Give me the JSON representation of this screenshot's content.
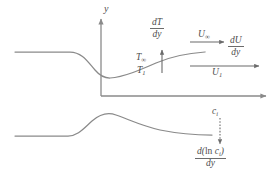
{
  "figure": {
    "type": "boundary-layer-gradient-diagram",
    "background_color": "#ffffff",
    "line_color": "#8a8a8a",
    "text_color": "#4d4d4d"
  },
  "axes": {
    "y_label": "y",
    "x_label": ""
  },
  "upper_plot": {
    "name": "temperature-profile",
    "curve_description": "flat at left, dips to minimum near axis, rises to right",
    "labels": {
      "T_infinity": "T",
      "T_infinity_sub": "∞",
      "T_one": "T",
      "T_one_sub": "1",
      "U_infinity": "U",
      "U_infinity_sub": "∞",
      "U_one": "U",
      "U_one_sub": "1"
    },
    "gradients": {
      "dT_dy_num": "dT",
      "dT_dy_den": "dy",
      "dU_dy_num": "dU",
      "dU_dy_den": "dy"
    }
  },
  "lower_plot": {
    "name": "concentration-profile",
    "curve_description": "flat at left, rises to a peak, then decays gently to right",
    "labels": {
      "c_i": "c",
      "c_i_sub": "i"
    },
    "gradients": {
      "dlnci_dy_num_pre": "d(",
      "dlnci_dy_num_ln": "ln",
      "dlnci_dy_num_c": "c",
      "dlnci_dy_num_sub": "i",
      "dlnci_dy_num_post": ")",
      "dlnci_dy_den": "dy"
    }
  }
}
